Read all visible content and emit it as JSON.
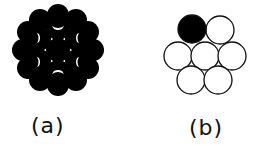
{
  "figure": {
    "panels": [
      {
        "id": "a",
        "label": "(a)",
        "description": "dense close-packed cluster of filled circles",
        "fill_color": "#000000"
      },
      {
        "id": "b",
        "label": "(b)",
        "description": "hexagonal arrangement of 7 outlined circles with one filled",
        "stroke_color": "#000000",
        "filled_circle": "top-left"
      }
    ]
  }
}
